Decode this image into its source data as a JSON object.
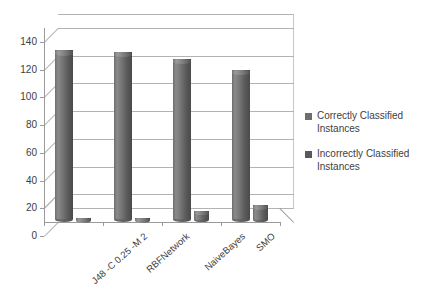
{
  "chart_data": {
    "type": "bar",
    "title": "",
    "subtitle": "",
    "xlabel": "",
    "ylabel": "",
    "ylim": [
      0,
      140
    ],
    "ytick_step": 20,
    "yticks": [
      "0",
      "20",
      "40",
      "60",
      "80",
      "100",
      "120",
      "140"
    ],
    "grid": true,
    "legend_position": "right",
    "style": "3d-cylinder",
    "categories": [
      "J48 -C 0.25 -M 2",
      "RBFNetwork",
      "NaiveBayes",
      "SMO"
    ],
    "series": [
      {
        "name": "Correctly Classified Instances",
        "color": "#6e6e6e",
        "values": [
          124,
          123,
          118,
          110
        ]
      },
      {
        "name": "Incorrectly Classified Instances",
        "color": "#595959",
        "values": [
          1,
          1,
          8,
          12
        ]
      }
    ]
  },
  "legend": {
    "items": [
      {
        "label_line1": "Correctly Classified",
        "label_line2": "Instances",
        "swatch": "#6e6e6e"
      },
      {
        "label_line1": "Incorrectly Classified",
        "label_line2": "Instances",
        "swatch": "#595959"
      }
    ]
  },
  "axis": {
    "y_color": "#9a9a9a",
    "grid_color": "#b3b3b3"
  }
}
